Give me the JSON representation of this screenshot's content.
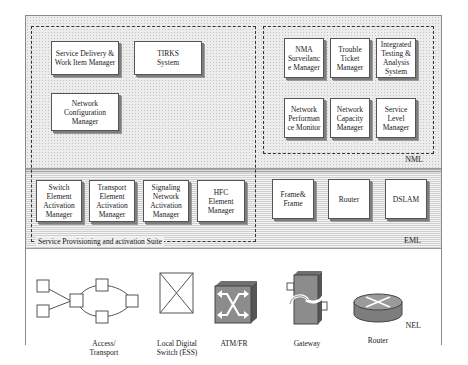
{
  "layers": {
    "nml": {
      "label": "NML"
    },
    "eml": {
      "label": "EML"
    },
    "nel": {
      "label": "NEL"
    }
  },
  "suite": {
    "label": "Service Provisioning and activation Suite"
  },
  "nml_left_boxes": [
    {
      "label": "Service Delivery &\nWork Item Manager"
    },
    {
      "label": "TIRKS\nSystem"
    },
    {
      "label": "Network\nConfiguration\nManager"
    }
  ],
  "nml_right_boxes": [
    {
      "label": "NMA\nSurveilanc\ne Manager"
    },
    {
      "label": "Trouble\nTicket\nManager"
    },
    {
      "label": "Integrated\nTesting &\nAnalysis\nSystem"
    },
    {
      "label": "Network\nPerforman\nce Monitor"
    },
    {
      "label": "Network\nCapacity\nManager"
    },
    {
      "label": "Service\nLevel\nManager"
    }
  ],
  "eml_suite_boxes": [
    {
      "label": "Switch\nElement\nActivation\nManager"
    },
    {
      "label": "Transport\nElement\nActivation\nManager"
    },
    {
      "label": "Signaling\nNetwork\nActivation\nManager"
    },
    {
      "label": "HFC\nElement\nManager"
    }
  ],
  "eml_other_boxes": [
    {
      "label": "Frame&\nFrame"
    },
    {
      "label": "Router"
    },
    {
      "label": "DSLAM"
    }
  ],
  "nel_devices": [
    {
      "label": "Access/\nTransport",
      "icon": "ring-topology-icon"
    },
    {
      "label": "Local Digital\nSwitch (ESS)",
      "icon": "crossed-box-icon"
    },
    {
      "label": "ATM/FR",
      "icon": "atm-switch-icon"
    },
    {
      "label": "Gateway",
      "icon": "gateway-icon"
    },
    {
      "label": "Router",
      "icon": "router-icon"
    }
  ],
  "colors": {
    "device_gray": "#8c8c8c",
    "line": "#555555"
  }
}
